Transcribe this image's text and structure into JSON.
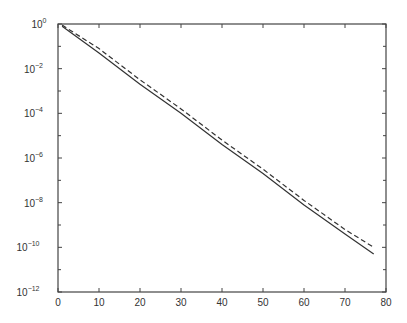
{
  "chart_data": {
    "type": "line",
    "title": "",
    "xlabel": "",
    "ylabel": "",
    "xscale": "linear",
    "yscale": "log",
    "xlim": [
      0,
      80
    ],
    "ylim": [
      1e-12,
      1
    ],
    "grid": false,
    "legend": null,
    "x_ticks": [
      0,
      10,
      20,
      30,
      40,
      50,
      60,
      70,
      80
    ],
    "x_tick_labels": [
      "0",
      "10",
      "20",
      "30",
      "40",
      "50",
      "60",
      "70",
      "80"
    ],
    "y_ticks_exponents": [
      0,
      -2,
      -4,
      -6,
      -8,
      -10,
      -12
    ],
    "y_tick_labels": [
      "10^0",
      "10^-2",
      "10^-4",
      "10^-6",
      "10^-8",
      "10^-10",
      "10^-12"
    ],
    "y_minor_ticks_exponents": [
      -1,
      -3,
      -5,
      -7,
      -9,
      -11
    ],
    "series": [
      {
        "name": "solid",
        "style": "solid",
        "color": "#333333",
        "x": [
          1,
          10,
          20,
          30,
          40,
          50,
          60,
          70,
          77
        ],
        "log10_y": [
          -0.1,
          -1.3,
          -2.7,
          -4.0,
          -5.4,
          -6.7,
          -8.1,
          -9.4,
          -10.3
        ]
      },
      {
        "name": "dashed",
        "style": "dashed",
        "color": "#333333",
        "x": [
          1,
          10,
          20,
          30,
          40,
          50,
          60,
          70,
          77
        ],
        "log10_y": [
          -0.05,
          -1.1,
          -2.5,
          -3.8,
          -5.2,
          -6.5,
          -7.9,
          -9.2,
          -10.0
        ]
      }
    ]
  },
  "colors": {
    "axis": "#444444",
    "line": "#333333",
    "background": "#ffffff"
  },
  "layout": {
    "plot_left": 58,
    "plot_right": 386,
    "plot_top": 24,
    "plot_bottom": 292
  }
}
